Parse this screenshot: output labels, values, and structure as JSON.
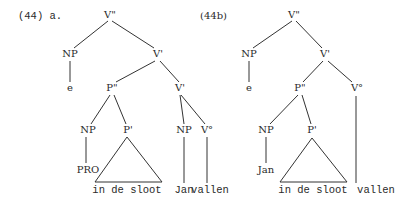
{
  "diagrams": [
    {
      "id": "a",
      "label": "(44) a.",
      "nodes": {
        "root": "V\"",
        "np_spec": "NP",
        "vbar": "V'",
        "e": "e",
        "pbarbar": "P\"",
        "vbar_low": "V'",
        "np_pro": "NP",
        "pbar": "P'",
        "np_jan": "NP",
        "v0": "V°",
        "pro": "PRO",
        "pp_text": "in de sloot",
        "jan": "Jan",
        "vallen": "vallen"
      }
    },
    {
      "id": "b",
      "label": "(44b)",
      "nodes": {
        "root": "V\"",
        "np_spec": "NP",
        "vbar": "V'",
        "e": "e",
        "pbarbar": "P\"",
        "v0": "V°",
        "np_jan": "NP",
        "pbar": "P'",
        "jan": "Jan",
        "pp_text": "in de sloot",
        "vallen": "vallen"
      }
    }
  ],
  "colors": {
    "ink": "#2a2a2a",
    "background": "#ffffff"
  }
}
